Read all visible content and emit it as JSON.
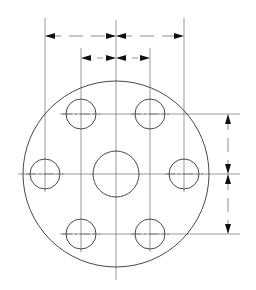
{
  "drawing": {
    "type": "flange bolt-hole pattern",
    "colors": {
      "line": "#333333",
      "background": "#ffffff",
      "arrow": "#111111"
    },
    "outer_circle": {
      "cx": 116,
      "cy": 174,
      "r": 93
    },
    "center_hole": {
      "cx": 116,
      "cy": 174,
      "r": 23
    },
    "holes": [
      {
        "name": "top-left",
        "cx": 81,
        "cy": 114,
        "r": 15
      },
      {
        "name": "top-right",
        "cx": 150,
        "cy": 114,
        "r": 15
      },
      {
        "name": "mid-left",
        "cx": 45,
        "cy": 174,
        "r": 15
      },
      {
        "name": "mid-right",
        "cx": 184,
        "cy": 174,
        "r": 15
      },
      {
        "name": "bottom-left",
        "cx": 81,
        "cy": 234,
        "r": 15
      },
      {
        "name": "bottom-right",
        "cx": 150,
        "cy": 234,
        "r": 15
      }
    ],
    "dimensions": {
      "horizontal_outer": {
        "y": 36,
        "x_left": 45,
        "x_mid": 116,
        "x_right": 184
      },
      "horizontal_inner": {
        "y": 58,
        "x_left": 81,
        "x_mid": 116,
        "x_right": 150
      },
      "vertical_right": {
        "x": 228,
        "y_top": 114,
        "y_mid": 174,
        "y_bottom": 234
      }
    },
    "labels": []
  }
}
